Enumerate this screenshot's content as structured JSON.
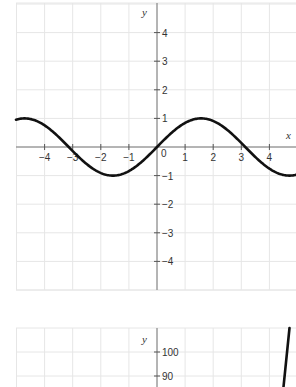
{
  "chart_data": [
    {
      "type": "line",
      "title": "",
      "function": "y = sin x",
      "xlabel": "x",
      "ylabel": "y",
      "xlim": [
        -5,
        5
      ],
      "ylim": [
        -5.1,
        5.1
      ],
      "grid": true,
      "x_ticks": [
        "-4",
        "-3",
        "-2",
        "-1",
        "0",
        "1",
        "2",
        "3",
        "4"
      ],
      "y_ticks": [
        "4",
        "3",
        "2",
        "1",
        "-1",
        "-2",
        "-3",
        "-4"
      ],
      "origin_label": "0",
      "series": [
        {
          "name": "sin x",
          "x": [
            -5,
            -4.712,
            -4,
            -3.1416,
            -2,
            -1.5708,
            -1,
            0,
            1,
            1.5708,
            2,
            3.1416,
            4,
            4.712,
            5
          ],
          "values": [
            0.959,
            1,
            0.757,
            0,
            -0.909,
            -1,
            -0.841,
            0,
            0.841,
            1,
            0.909,
            0,
            -0.757,
            -1,
            -0.959
          ]
        }
      ]
    },
    {
      "type": "line",
      "title": "",
      "xlabel": "",
      "ylabel": "y",
      "grid": true,
      "y_ticks": [
        "100",
        "90"
      ],
      "partial": true,
      "series": [
        {
          "name": "steep curve",
          "x": [
            4.7,
            4.95
          ],
          "values": [
            85,
            110
          ]
        }
      ]
    }
  ],
  "labels": {
    "chart1": {
      "x_axis": "x",
      "y_axis": "y",
      "origin": "0",
      "x_ticks": [
        {
          "v": -4,
          "t": "−4"
        },
        {
          "v": -3,
          "t": "−3"
        },
        {
          "v": -2,
          "t": "−2"
        },
        {
          "v": -1,
          "t": "−1"
        },
        {
          "v": 1,
          "t": "1"
        },
        {
          "v": 2,
          "t": "2"
        },
        {
          "v": 3,
          "t": "3"
        },
        {
          "v": 4,
          "t": "4"
        }
      ],
      "y_ticks": [
        {
          "v": 4,
          "t": "4"
        },
        {
          "v": 3,
          "t": "3"
        },
        {
          "v": 2,
          "t": "2"
        },
        {
          "v": 1,
          "t": "1"
        },
        {
          "v": -1,
          "t": "−1"
        },
        {
          "v": -2,
          "t": "−2"
        },
        {
          "v": -3,
          "t": "−3"
        },
        {
          "v": -4,
          "t": "−4"
        }
      ]
    },
    "chart2": {
      "y_axis": "y",
      "y_ticks": [
        {
          "v": 100,
          "t": "100"
        },
        {
          "v": 90,
          "t": "90"
        }
      ]
    }
  },
  "colors": {
    "curve": "#111111",
    "grid": "#e6e6e6",
    "axis": "#777777"
  }
}
